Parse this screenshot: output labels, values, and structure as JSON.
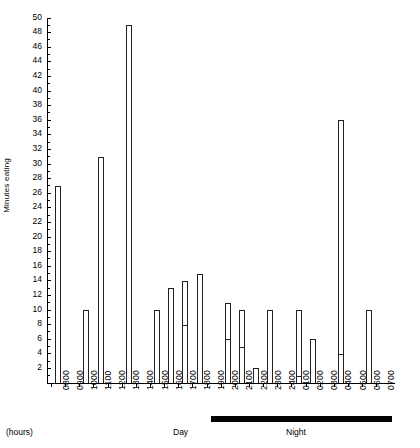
{
  "chart_data": {
    "type": "bar",
    "title": "",
    "xlabel": "(hours)",
    "ylabel": "Minutes eating",
    "ylim": [
      0,
      50
    ],
    "ytick_step": 2,
    "grid": false,
    "legend": null,
    "categories": [
      "0800",
      "0900",
      "1000",
      "1100",
      "1200",
      "1300",
      "1400",
      "1500",
      "1600",
      "1700",
      "1800",
      "1900",
      "2000",
      "2100",
      "2200",
      "2300",
      "2400",
      "0100",
      "0200",
      "0300",
      "0400",
      "0500",
      "0600",
      "0700"
    ],
    "values": [
      27,
      0,
      10,
      31,
      0,
      49,
      0,
      10,
      13,
      14,
      15,
      0,
      11,
      10,
      2,
      10,
      0,
      10,
      6,
      0,
      36,
      0,
      10,
      0
    ],
    "sublevels": [
      null,
      null,
      null,
      null,
      null,
      null,
      null,
      null,
      null,
      8,
      null,
      null,
      6,
      5,
      null,
      null,
      null,
      1,
      null,
      null,
      4,
      null,
      null,
      null
    ],
    "ytick_labels": [
      "2",
      "4",
      "6",
      "8",
      "10",
      "12",
      "14",
      "16",
      "18",
      "20",
      "22",
      "24",
      "26",
      "28",
      "30",
      "32",
      "34",
      "36",
      "38",
      "40",
      "42",
      "44",
      "46",
      "48",
      "50"
    ],
    "ytick_values": [
      2,
      4,
      6,
      8,
      10,
      12,
      14,
      16,
      18,
      20,
      22,
      24,
      26,
      28,
      30,
      32,
      34,
      36,
      38,
      40,
      42,
      44,
      46,
      48,
      50
    ],
    "annotations": [
      {
        "name": "hours-label",
        "text": "(hours)"
      },
      {
        "name": "day-label",
        "text": "Day"
      },
      {
        "name": "night-label",
        "text": "Night"
      }
    ]
  },
  "axis": {
    "y_title": "Minutes eating",
    "hours_note": "(hours)",
    "day_period": "Day",
    "night_period": "Night"
  },
  "colors": {
    "bar_stroke": "#222222",
    "bar_fill": "#ffffff",
    "axis": "#000000",
    "night_band": "#000000",
    "background": "#ffffff"
  }
}
